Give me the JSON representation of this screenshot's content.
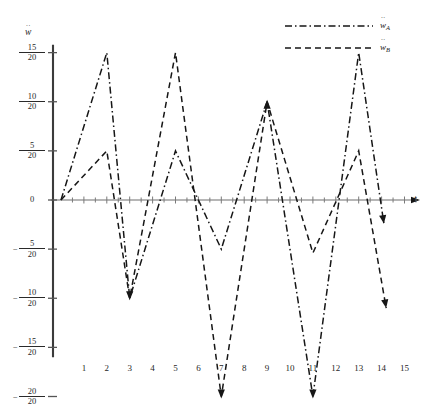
{
  "chart_data": {
    "type": "line",
    "title": "",
    "xlabel": "t",
    "ylabel": "ẇ",
    "xlim": [
      -0.45,
      15.9
    ],
    "ylim": [
      -1.05,
      0.82
    ],
    "grid": false,
    "legend_position": "top-right",
    "y_tick_values": [
      0.75,
      0.5,
      0.25,
      0,
      -0.25,
      -0.5,
      -0.75,
      -1.0
    ],
    "y_tick_labels": [
      {
        "sign": "",
        "num": "15",
        "den": "20"
      },
      {
        "sign": "",
        "num": "10",
        "den": "20"
      },
      {
        "sign": "",
        "num": "5",
        "den": "20"
      },
      {
        "sign": "",
        "num": "0",
        "den": ""
      },
      {
        "sign": "−",
        "num": "5",
        "den": "20"
      },
      {
        "sign": "−",
        "num": "10",
        "den": "20"
      },
      {
        "sign": "−",
        "num": "15",
        "den": "20"
      },
      {
        "sign": "−",
        "num": "20",
        "den": "20"
      }
    ],
    "x_tick_labels": [
      "1",
      "2",
      "3",
      "4",
      "5",
      "6",
      "7",
      "8",
      "9",
      "10",
      "11",
      "12",
      "13",
      "14",
      "15"
    ],
    "x_tick_values": [
      1,
      2,
      3,
      4,
      5,
      6,
      7,
      8,
      9,
      10,
      11,
      12,
      13,
      14,
      15
    ],
    "x_minor_ticks": [
      0.5,
      1.5,
      2.5,
      3.5,
      4.5,
      5.5,
      6.5,
      7.5,
      8.5,
      9.5,
      10.5,
      11.5,
      12.5,
      13.5,
      14.5,
      15.5
    ],
    "series": [
      {
        "name": "ẇA",
        "label_base": "w",
        "label_sub": "A",
        "style": "dash-dot",
        "color": "#161616",
        "end_arrow": true,
        "points": [
          {
            "x": 0,
            "y": 0
          },
          {
            "x": 2,
            "y": 0.75
          },
          {
            "x": 3,
            "y": -0.5
          },
          {
            "x": 5,
            "y": 0.25
          },
          {
            "x": 7,
            "y": -0.25
          },
          {
            "x": 9,
            "y": 0.5
          },
          {
            "x": 11,
            "y": -1.0
          },
          {
            "x": 13,
            "y": 0.75
          },
          {
            "x": 14.1,
            "y": -0.12
          }
        ]
      },
      {
        "name": "ẇB",
        "label_base": "w",
        "label_sub": "B",
        "style": "dashed",
        "color": "#161616",
        "end_arrow": true,
        "points": [
          {
            "x": 0,
            "y": 0
          },
          {
            "x": 2,
            "y": 0.25
          },
          {
            "x": 3,
            "y": -0.5
          },
          {
            "x": 5,
            "y": 0.75
          },
          {
            "x": 7,
            "y": -1.0
          },
          {
            "x": 9,
            "y": 0.5
          },
          {
            "x": 11,
            "y": -0.27
          },
          {
            "x": 13,
            "y": 0.25
          },
          {
            "x": 14.2,
            "y": -0.55
          }
        ]
      }
    ],
    "converge_markers": [
      {
        "x": 3,
        "y": -0.5,
        "direction": "down"
      },
      {
        "x": 7,
        "y": -1.0,
        "direction": "down"
      },
      {
        "x": 9,
        "y": 0.5,
        "direction": "up"
      },
      {
        "x": 11,
        "y": -1.0,
        "direction": "down"
      }
    ]
  },
  "legend": {
    "entries": [
      {
        "label_base": "w",
        "label_sub": "A",
        "style": "dash-dot"
      },
      {
        "label_base": "w",
        "label_sub": "B",
        "style": "dashed"
      }
    ]
  }
}
